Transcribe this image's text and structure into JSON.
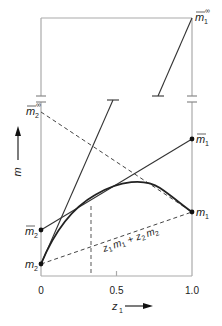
{
  "figure": {
    "type": "partial-molar-diagram",
    "x_axis": {
      "label": "z",
      "label_sub": "1",
      "ticks": [
        "0",
        "0.5",
        "1.0"
      ]
    },
    "y_axis": {
      "label": "m"
    },
    "points": {
      "m1_inf": {
        "base": "m",
        "sub": "1",
        "sup": "∞",
        "bar": true
      },
      "m2_inf": {
        "base": "m",
        "sub": "2",
        "sup": "∞",
        "bar": true
      },
      "m1_bar": {
        "base": "m",
        "sub": "1",
        "bar": true
      },
      "m2_bar": {
        "base": "m",
        "sub": "2",
        "bar": true
      },
      "m1": {
        "base": "m",
        "sub": "1"
      },
      "m2": {
        "base": "m",
        "sub": "2"
      }
    },
    "ideal_line_label": {
      "z1": "z",
      "z1_sub": "1",
      "m1": "m",
      "m1_sub": "1",
      "plus": "+",
      "z2": "z",
      "z2_sub": "2",
      "m2": "m",
      "m2_sub": "2"
    },
    "colors": {
      "axis": "#aaaaaa",
      "curve": "#222222",
      "line": "#333333",
      "dashed": "#444444"
    }
  }
}
